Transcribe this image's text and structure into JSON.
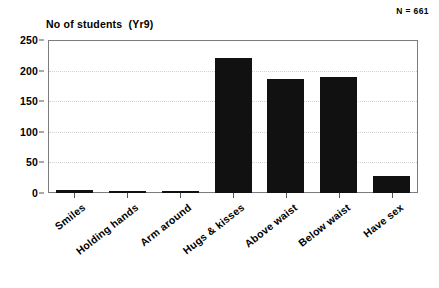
{
  "annotation": {
    "sample_size_label": "N = 661"
  },
  "chart_data": {
    "type": "bar",
    "title": "No of students  (Yr9)",
    "xlabel": "",
    "ylabel": "",
    "categories": [
      "Smiles",
      "Holding hands",
      "Arm around",
      "Hugs & kisses",
      "Above waist",
      "Below waist",
      "Have sex"
    ],
    "values": [
      5,
      3,
      3,
      220,
      186,
      190,
      28
    ],
    "ylim": [
      0,
      250
    ],
    "yticks": [
      0,
      50,
      100,
      150,
      200,
      250
    ],
    "ytick_labels": [
      "0",
      "50",
      "100",
      "150",
      "200",
      "250"
    ],
    "grid": "horizontal-dotted",
    "legend": "none",
    "bar_color": "#111111",
    "annotations": [
      "N = 661"
    ]
  }
}
